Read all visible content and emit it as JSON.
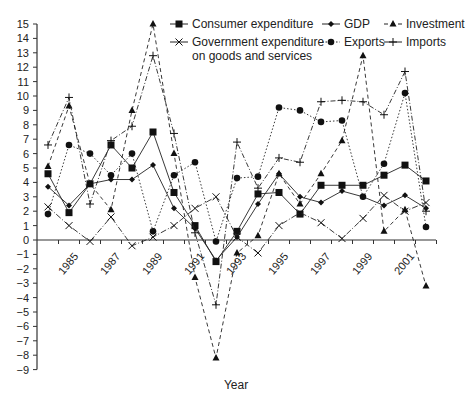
{
  "chart_data": {
    "type": "line",
    "title": "",
    "xlabel": "Year",
    "ylabel": "",
    "ylim": [
      -9,
      15
    ],
    "yticks": [
      -9,
      -8,
      -7,
      -6,
      -5,
      -4,
      -3,
      -2,
      -1,
      0,
      1,
      2,
      3,
      4,
      5,
      6,
      7,
      8,
      9,
      10,
      11,
      12,
      13,
      14,
      15
    ],
    "x": [
      1984,
      1985,
      1986,
      1987,
      1988,
      1989,
      1990,
      1991,
      1992,
      1993,
      1994,
      1995,
      1996,
      1997,
      1998,
      1999,
      2000,
      2001,
      2002
    ],
    "xtick_labels": [
      "1985",
      "1987",
      "1989",
      "1991",
      "1993",
      "1995",
      "1997",
      "1999",
      "2001"
    ],
    "grid": false,
    "legend_position": "top",
    "series": [
      {
        "name": "Consumer expenditure",
        "marker": "square",
        "dash": "solid",
        "values": [
          4.6,
          1.9,
          3.9,
          6.6,
          5.0,
          7.5,
          3.3,
          1.0,
          -1.5,
          0.6,
          3.2,
          3.3,
          1.8,
          3.8,
          3.8,
          3.8,
          4.5,
          5.2,
          4.1
        ]
      },
      {
        "name": "GDP",
        "marker": "diamond",
        "dash": "solid",
        "values": [
          3.7,
          2.4,
          3.9,
          4.2,
          4.2,
          5.2,
          2.2,
          0.8,
          -1.4,
          0.2,
          2.5,
          4.6,
          3.0,
          2.6,
          3.4,
          3.0,
          2.4,
          3.1,
          2.2
        ]
      },
      {
        "name": "Investment",
        "marker": "triangle",
        "dash": "dashed",
        "values": [
          5.1,
          9.3,
          3.9,
          2.1,
          9.0,
          15.0,
          6.0,
          -2.6,
          -8.2,
          -0.9,
          0.3,
          4.6,
          2.5,
          4.6,
          6.9,
          12.8,
          0.6,
          2.1,
          -3.2
        ]
      },
      {
        "name": "Government expenditure on goods and services",
        "marker": "x",
        "dash": "dashdot",
        "values": [
          2.3,
          1.0,
          -0.1,
          1.6,
          -0.4,
          0.2,
          1.0,
          2.2,
          3.0,
          0.2,
          -0.9,
          1.0,
          1.9,
          1.2,
          0.1,
          1.5,
          3.1,
          2.0,
          2.6
        ]
      },
      {
        "name": "Exports",
        "marker": "circle",
        "dash": "dotted",
        "values": [
          1.8,
          6.6,
          6.0,
          4.5,
          6.0,
          0.6,
          4.5,
          5.4,
          -0.1,
          4.3,
          4.4,
          9.2,
          9.0,
          8.2,
          8.3,
          3.0,
          5.3,
          10.2,
          0.9
        ]
      },
      {
        "name": "Imports",
        "marker": "plus",
        "dash": "dashdot2",
        "values": [
          6.6,
          9.9,
          2.5,
          6.9,
          7.9,
          12.8,
          7.4,
          0.5,
          -4.5,
          6.8,
          3.6,
          5.7,
          5.4,
          9.6,
          9.7,
          9.6,
          8.7,
          11.7,
          2.0
        ]
      }
    ]
  },
  "legend": [
    {
      "label": "Consumer expenditure"
    },
    {
      "label": "GDP"
    },
    {
      "label": "Investment"
    },
    {
      "label": "Government expenditure"
    },
    {
      "label": "on goods and services"
    },
    {
      "label": "Exports"
    },
    {
      "label": "Imports"
    }
  ]
}
